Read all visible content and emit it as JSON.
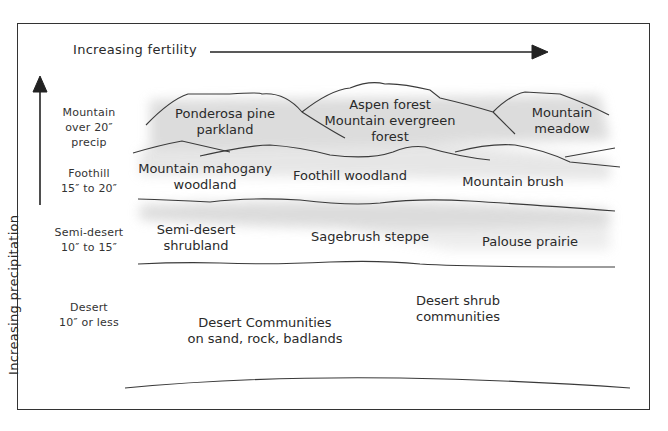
{
  "diagram": {
    "x_axis_label": "Increasing fertility",
    "y_axis_label": "Increasing precipitation",
    "precipitation_zones": [
      {
        "name": "Mountain",
        "range": "over 20″",
        "extra": "precip"
      },
      {
        "name": "Foothill",
        "range": "15″ to 20″"
      },
      {
        "name": "Semi-desert",
        "range": "10″ to 15″"
      },
      {
        "name": "Desert",
        "range": "10″ or less"
      }
    ],
    "communities": {
      "mountain": [
        {
          "line1": "Ponderosa pine",
          "line2": "parkland"
        },
        {
          "line1": "Aspen forest",
          "line2": "Mountain evergreen",
          "line3": "forest"
        },
        {
          "line1": "Mountain",
          "line2": "meadow"
        }
      ],
      "foothill": [
        {
          "line1": "Mountain mahogany",
          "line2": "woodland"
        },
        {
          "line1": "Foothill woodland"
        },
        {
          "line1": "Mountain brush"
        }
      ],
      "semi_desert": [
        {
          "line1": "Semi-desert",
          "line2": "shrubland"
        },
        {
          "line1": "Sagebrush steppe"
        },
        {
          "line1": "Palouse prairie"
        }
      ],
      "desert": [
        {
          "line1": "Desert Communities",
          "line2": "on sand, rock, badlands"
        },
        {
          "line1": "Desert shrub",
          "line2": "communities"
        }
      ]
    },
    "colors": {
      "line": "#3a3a3a",
      "shade": "#d8d8d8",
      "border": "#333333"
    }
  }
}
